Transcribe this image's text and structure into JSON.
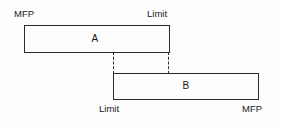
{
  "diagram": {
    "background_color": "#fdfdfd",
    "line_color": "#2b2b2b",
    "bars": [
      {
        "id": "a",
        "letter": "A",
        "left_label": "MFP",
        "right_label": "Limit",
        "label_position": "above"
      },
      {
        "id": "b",
        "letter": "B",
        "left_label": "Limit",
        "right_label": "MFP",
        "label_position": "below"
      }
    ],
    "connectors": [
      {
        "id": "left",
        "style": "dashed"
      },
      {
        "id": "right",
        "style": "dashed"
      }
    ]
  }
}
